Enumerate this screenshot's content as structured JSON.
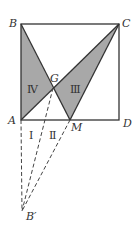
{
  "diagram": {
    "points": {
      "B": {
        "label": "B",
        "x": 21,
        "y": 24
      },
      "C": {
        "label": "C",
        "x": 119,
        "y": 24
      },
      "A": {
        "label": "A",
        "x": 21,
        "y": 120
      },
      "D": {
        "label": "D",
        "x": 119,
        "y": 120
      },
      "G": {
        "label": "G",
        "x": 53,
        "y": 88
      },
      "M": {
        "label": "M",
        "x": 70,
        "y": 120
      },
      "Bp": {
        "label": "B′",
        "x": 22,
        "y": 211
      }
    },
    "regions": {
      "r1": "Ⅰ",
      "r2": "Ⅱ",
      "r3": "Ⅲ",
      "r4": "Ⅳ"
    },
    "colors": {
      "shade": "#a8a8a8",
      "line": "#333333"
    }
  }
}
